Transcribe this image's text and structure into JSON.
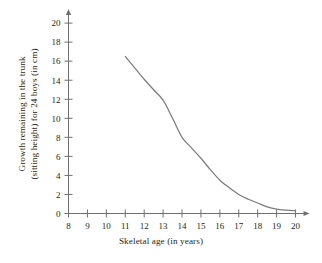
{
  "chart_data": {
    "type": "line",
    "title": "",
    "xlabel": "Skeletal age (in years)",
    "ylabel_line1": "Growth remaining in the trunk",
    "ylabel_line2": "(sitting height) for 24 boys (in cm)",
    "xlim": [
      8,
      20
    ],
    "ylim": [
      0,
      20
    ],
    "xticks": [
      8,
      9,
      10,
      11,
      12,
      13,
      14,
      15,
      16,
      17,
      18,
      19,
      20
    ],
    "yticks": [
      0,
      2,
      4,
      6,
      8,
      10,
      12,
      14,
      16,
      18,
      20
    ],
    "xtick_labels": [
      "8",
      "9",
      "10",
      "11",
      "12",
      "13",
      "14",
      "15",
      "16",
      "17",
      "18",
      "19",
      "20"
    ],
    "ytick_labels": [
      "0",
      "2",
      "4",
      "6",
      "8",
      "10",
      "12",
      "14",
      "16",
      "18",
      "20"
    ],
    "grid": false,
    "legend": "none",
    "series": [
      {
        "name": "Growth remaining",
        "color": "#7c7c7c",
        "x": [
          11.0,
          11.5,
          12.0,
          12.5,
          13.0,
          13.5,
          14.0,
          14.5,
          15.0,
          15.5,
          16.0,
          16.5,
          17.0,
          17.5,
          18.0,
          18.5,
          19.0,
          19.5,
          20.0
        ],
        "y": [
          16.5,
          15.3,
          14.1,
          13.0,
          11.9,
          10.0,
          8.0,
          6.9,
          5.8,
          4.6,
          3.5,
          2.7,
          2.0,
          1.5,
          1.1,
          0.7,
          0.45,
          0.35,
          0.3
        ]
      }
    ]
  }
}
